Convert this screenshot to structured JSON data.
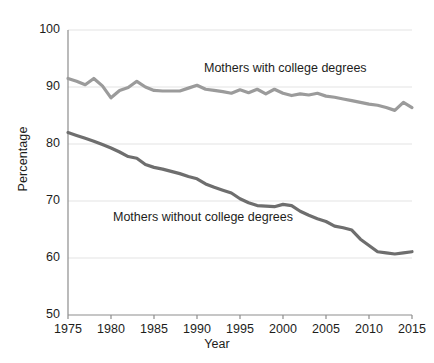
{
  "chart_data": {
    "type": "line",
    "title": "",
    "xlabel": "Year",
    "ylabel": "Percentage",
    "xlim": [
      1975,
      2015
    ],
    "ylim": [
      50,
      100
    ],
    "ytick_values": [
      50,
      60,
      70,
      80,
      90,
      100
    ],
    "ytick_labels": [
      "50",
      "60",
      "70",
      "80",
      "90",
      "100"
    ],
    "xtick_values": [
      1975,
      1980,
      1985,
      1990,
      1995,
      2000,
      2005,
      2010,
      2015
    ],
    "xtick_labels": [
      "1975",
      "1980",
      "1985",
      "1990",
      "1995",
      "2000",
      "2005",
      "2010",
      "2015"
    ],
    "grid": "horizontal",
    "legend": "inline-labels",
    "x": [
      1975,
      1976,
      1977,
      1978,
      1979,
      1980,
      1981,
      1982,
      1983,
      1984,
      1985,
      1986,
      1987,
      1988,
      1989,
      1990,
      1991,
      1992,
      1993,
      1994,
      1995,
      1996,
      1997,
      1998,
      1999,
      2000,
      2001,
      2002,
      2003,
      2004,
      2005,
      2006,
      2007,
      2008,
      2009,
      2010,
      2011,
      2012,
      2013,
      2014,
      2015
    ],
    "series": [
      {
        "name": "Mothers with college degrees",
        "color": "#9b9b9b",
        "label_position": {
          "x": 204,
          "y": 61
        },
        "values": [
          91.5,
          91.0,
          90.4,
          91.5,
          90.2,
          88.1,
          89.4,
          89.9,
          91.0,
          90.0,
          89.4,
          89.3,
          89.3,
          89.3,
          89.8,
          90.3,
          89.6,
          89.4,
          89.2,
          88.9,
          89.5,
          89.0,
          89.6,
          88.8,
          89.6,
          88.9,
          88.5,
          88.8,
          88.6,
          88.9,
          88.4,
          88.2,
          87.9,
          87.6,
          87.3,
          87.0,
          86.8,
          86.4,
          85.9,
          87.3,
          86.4
        ]
      },
      {
        "name": "Mothers without college degrees",
        "color": "#6e6e6e",
        "label_position": {
          "x": 113,
          "y": 210
        },
        "values": [
          82.0,
          81.5,
          81.0,
          80.5,
          79.9,
          79.3,
          78.6,
          77.8,
          77.5,
          76.4,
          75.9,
          75.6,
          75.2,
          74.8,
          74.3,
          73.9,
          73.0,
          72.4,
          71.9,
          71.4,
          70.4,
          69.7,
          69.2,
          69.1,
          69.0,
          69.4,
          69.2,
          68.2,
          67.5,
          66.9,
          66.4,
          65.6,
          65.3,
          64.9,
          63.3,
          62.2,
          61.1,
          60.9,
          60.7,
          60.9,
          61.1
        ]
      }
    ]
  },
  "labels": {
    "series_with": "Mothers with college degrees",
    "series_without": "Mothers without college degrees",
    "axis_x": "Year",
    "axis_y": "Percentage"
  },
  "colors": {
    "series_with": "#9b9b9b",
    "series_without": "#6e6e6e",
    "grid": "#e3e3e3",
    "axis": "#8d8d8d",
    "text": "#1d1d1b",
    "background": "#ffffff"
  }
}
